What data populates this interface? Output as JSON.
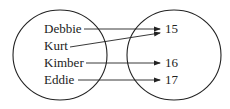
{
  "diagram": {
    "type": "mapping",
    "domain": [
      "Debbie",
      "Kurt",
      "Kimber",
      "Eddie"
    ],
    "range": [
      "15",
      "16",
      "17"
    ],
    "mappings": [
      {
        "from": "Debbie",
        "to": "15"
      },
      {
        "from": "Kurt",
        "to": "15"
      },
      {
        "from": "Kimber",
        "to": "16"
      },
      {
        "from": "Eddie",
        "to": "17"
      }
    ]
  },
  "colors": {
    "stroke": "#222222",
    "background": "#ffffff"
  }
}
